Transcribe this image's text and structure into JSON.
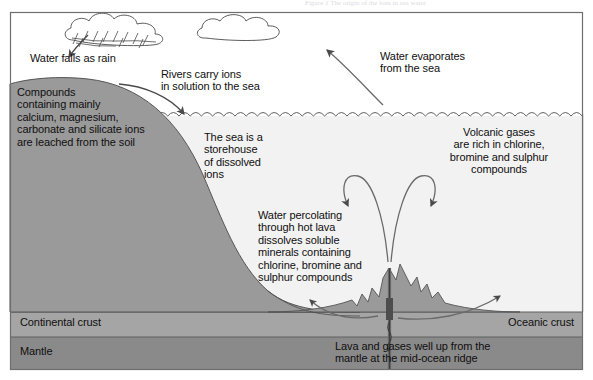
{
  "figure": {
    "title": "The origin of the ions in sea water",
    "caption_faint": "Figure 1  The origin of the ions in sea water"
  },
  "colors": {
    "land": "#9a9a9a",
    "crust": "#a5a5a5",
    "mantle": "#8a8a8a",
    "sea": "#f2f2f2",
    "sky": "#ffffff",
    "outline": "#3a3a3a",
    "text": "#100f0f",
    "arrow": "#4a4a4a",
    "frame": "#6e6e6e"
  },
  "labels": {
    "rain": "Water falls as rain",
    "rivers": "Rivers carry ions\nin solution to the sea",
    "evaporation": "Water evaporates\nfrom the sea",
    "leaching": "Compounds\ncontaining mainly\ncalcium, magnesium,\ncarbonate and silicate ions\nare leached from the soil",
    "storehouse": "The sea is a\nstorehouse\nof dissolved\nions",
    "volcanic_gases": "Volcanic gases\nare rich in chlorine,\nbromine and sulphur\ncompounds",
    "percolation": "Water percolating\nthrough hot lava\ndissolves soluble\nminerals containing\nchlorine, bromine and\nsulphur compounds",
    "continental_crust": "Continental crust",
    "oceanic_crust": "Oceanic crust",
    "mantle": "Mantle",
    "ridge": "Lava and gases well up from the\nmantle at the mid-ocean ridge"
  },
  "icons": {
    "rain_cloud": "rain-cloud-icon",
    "plain_cloud": "cloud-icon",
    "rain_arrow": "rain-arrow-icon",
    "river_arrow": "river-arrow-icon",
    "evaporation_arrow": "evaporation-arrow-icon",
    "plume_left_arrow": "plume-left-arrow-icon",
    "plume_right_arrow": "plume-right-arrow-icon",
    "seafloor_spread_left_arrow": "seafloor-spreading-left-arrow-icon",
    "seafloor_spread_right_arrow": "seafloor-spreading-right-arrow-icon",
    "ridge_vent": "mid-ocean-ridge-vent-icon",
    "sea_surface": "wave-surface-icon"
  }
}
